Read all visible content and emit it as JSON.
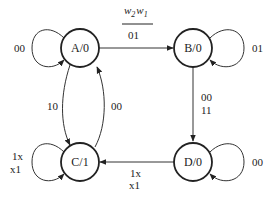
{
  "header": {
    "input_var_1": "w",
    "input_sub_1": "2",
    "input_var_2": "w",
    "input_sub_2": "1"
  },
  "states": {
    "A": {
      "label": "A/0"
    },
    "B": {
      "label": "B/0"
    },
    "C": {
      "label": "C/1"
    },
    "D": {
      "label": "D/0"
    }
  },
  "transitions": {
    "A_self": {
      "label": "00"
    },
    "A_to_B": {
      "label": "01"
    },
    "B_self": {
      "label": "01"
    },
    "B_to_D": {
      "line1": "00",
      "line2": "11"
    },
    "D_self": {
      "label": "00"
    },
    "D_to_C": {
      "line1": "1x",
      "line2": "x1"
    },
    "C_self": {
      "line1": "1x",
      "line2": "x1"
    },
    "A_to_C": {
      "label": "10"
    },
    "C_to_A": {
      "label": "00"
    }
  }
}
